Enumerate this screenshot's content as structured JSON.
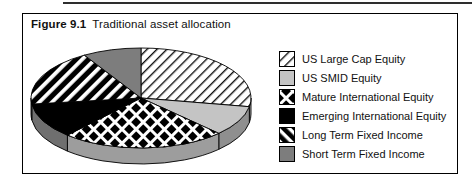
{
  "figure": {
    "label": "Figure 9.1",
    "title": "Traditional asset allocation"
  },
  "chart_data": {
    "type": "pie",
    "style": "3d",
    "title": "Traditional asset allocation",
    "legend_position": "right",
    "data_labels_shown": false,
    "slices": [
      {
        "label": "US Large Cap Equity",
        "value_pct": 28,
        "start_deg": 0,
        "end_deg": 100,
        "pattern": "thin-diagonal-hatch",
        "bg": "#ffffff",
        "fg": "#000000",
        "rim": "#a6a6a6"
      },
      {
        "label": "US SMID Equity",
        "value_pct": 10,
        "start_deg": 100,
        "end_deg": 135,
        "pattern": "solid",
        "bg": "#c4c4c4",
        "fg": "#c4c4c4",
        "rim": "#8f8f8f"
      },
      {
        "label": "Mature International Equity",
        "value_pct": 24,
        "start_deg": 135,
        "end_deg": 222,
        "pattern": "diamond-lattice",
        "bg": "#000000",
        "fg": "#ffffff",
        "rim": "#9d9d9d"
      },
      {
        "label": "Emerging International Equity",
        "value_pct": 11,
        "start_deg": 222,
        "end_deg": 263,
        "pattern": "solid",
        "bg": "#000000",
        "fg": "#000000",
        "rim": "#6f6f6f"
      },
      {
        "label": "Long Term Fixed Income",
        "value_pct": 18,
        "start_deg": 263,
        "end_deg": 329,
        "pattern": "thick-diagonal-stripes",
        "bg": "#000000",
        "fg": "#ffffff",
        "rim": "#4d4d4d"
      },
      {
        "label": "Short Term Fixed Income",
        "value_pct": 9,
        "start_deg": 329,
        "end_deg": 360,
        "pattern": "solid",
        "bg": "#7d7d7d",
        "fg": "#7d7d7d",
        "rim": "#7d7d7d"
      }
    ]
  }
}
